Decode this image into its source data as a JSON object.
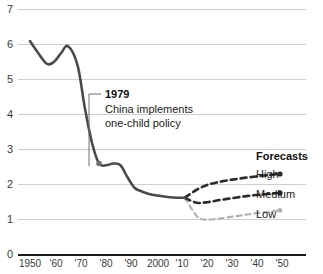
{
  "chart_data": {
    "type": "line",
    "title": "",
    "subtitle": "",
    "xlabel": "",
    "ylabel": "",
    "xlim": [
      1950,
      2060
    ],
    "ylim": [
      0,
      7
    ],
    "grid": true,
    "grid_axis": "y",
    "legend_position": "right",
    "y_ticks": [
      "7",
      "6",
      "5",
      "4",
      "3",
      "2",
      "1",
      "0"
    ],
    "y_tick_values": [
      7,
      6,
      5,
      4,
      3,
      2,
      1,
      0
    ],
    "x_ticks": [
      "1950",
      "'60",
      "'70",
      "'80",
      "'90",
      "2000",
      "'10",
      "'20",
      "'30",
      "'40",
      "'50"
    ],
    "x_tick_values": [
      1950,
      1960,
      1970,
      1980,
      1990,
      2000,
      2010,
      2020,
      2030,
      2040,
      2050
    ],
    "series": [
      {
        "name": "Historical",
        "style": "solid",
        "color": "#4a4a4a",
        "x": [
          1950,
          1953,
          1957,
          1960,
          1963,
          1966,
          1970,
          1973,
          1976,
          1979,
          1982,
          1985,
          1988,
          1991,
          1994,
          1997,
          2000,
          2005,
          2010,
          2015
        ],
        "values": [
          6.1,
          5.8,
          5.45,
          5.5,
          5.75,
          5.95,
          5.4,
          4.2,
          3.2,
          2.6,
          2.55,
          2.6,
          2.55,
          2.2,
          1.9,
          1.8,
          1.73,
          1.67,
          1.63,
          1.62
        ]
      },
      {
        "name": "High",
        "style": "dashed",
        "color": "#2b2b2b",
        "x": [
          2015,
          2020,
          2025,
          2030,
          2035,
          2040,
          2045,
          2050,
          2055
        ],
        "values": [
          1.62,
          1.85,
          2.0,
          2.08,
          2.14,
          2.19,
          2.23,
          2.27,
          2.3
        ]
      },
      {
        "name": "Medium",
        "style": "dashed",
        "color": "#2b2b2b",
        "x": [
          2015,
          2020,
          2025,
          2030,
          2035,
          2040,
          2045,
          2050,
          2055
        ],
        "values": [
          1.62,
          1.48,
          1.5,
          1.56,
          1.61,
          1.66,
          1.7,
          1.73,
          1.76
        ]
      },
      {
        "name": "Low",
        "style": "dashed",
        "color": "#b3b3b3",
        "x": [
          2015,
          2020,
          2023,
          2026,
          2030,
          2035,
          2040,
          2045,
          2050,
          2055
        ],
        "values": [
          1.62,
          1.1,
          1.0,
          1.0,
          1.03,
          1.08,
          1.13,
          1.18,
          1.22,
          1.26
        ]
      }
    ],
    "annotations": [
      {
        "id": "one-child-policy",
        "year_label": "1979",
        "text_line_1": "China implements",
        "text_line_2": "one-child policy",
        "point_x": 1979,
        "point_y": 2.6,
        "marker": true
      }
    ],
    "legend": {
      "title": "Forecasts",
      "entries": [
        {
          "label": "High",
          "color": "#2b2b2b",
          "style": "dashed"
        },
        {
          "label": "Medium",
          "color": "#2b2b2b",
          "style": "dashed"
        },
        {
          "label": "Low",
          "color": "#b3b3b3",
          "style": "dashed"
        }
      ]
    },
    "colors": {
      "historical": "#4a4a4a",
      "forecast_high": "#2b2b2b",
      "forecast_medium": "#2b2b2b",
      "forecast_low": "#b3b3b3",
      "gridline": "#cfcfcf",
      "axis": "#1a1a1a",
      "text": "#1a1a1a",
      "background": "#ffffff"
    }
  }
}
